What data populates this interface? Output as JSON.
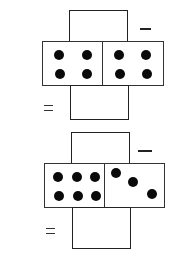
{
  "problems": [
    {
      "operator": "−",
      "equals": "=",
      "answer_top": "",
      "answer_bottom": "",
      "domino": {
        "left_pips": 4,
        "right_pips": 4
      }
    },
    {
      "operator": "−",
      "equals": "=",
      "answer_top": "",
      "answer_bottom": "",
      "domino": {
        "left_pips": 6,
        "right_pips": 3
      }
    }
  ]
}
